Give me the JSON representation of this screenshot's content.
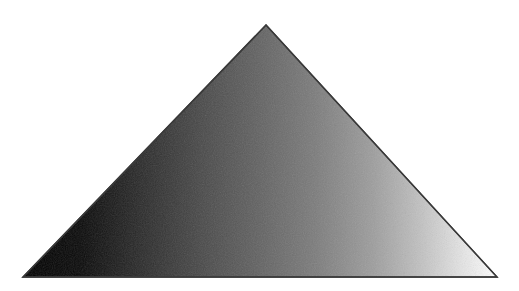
{
  "canvas": {
    "width": 519,
    "height": 291,
    "background_color": "#ffffff",
    "alt_label": "Gradient filled triangle"
  },
  "figure": {
    "name": "gradient-triangle",
    "shape_type": "triangle",
    "vertices": [
      {
        "label": "apex",
        "x": 266,
        "y": 25
      },
      {
        "label": "bottom-right",
        "x": 497,
        "y": 277
      },
      {
        "label": "bottom-left",
        "x": 23,
        "y": 277
      }
    ],
    "points_attr": "266,25 497,277 23,277",
    "stroke_color": "#3a3a3a",
    "stroke_width": 1.4,
    "texture": "fine-dither-noise"
  },
  "gradient": {
    "name": "horizontal-black-to-white",
    "direction": "horizontal",
    "x1": "0%",
    "y1": "0%",
    "x2": "100%",
    "y2": "0%",
    "stops": [
      {
        "offset": "0%",
        "color": "#000000"
      },
      {
        "offset": "12%",
        "color": "#090909"
      },
      {
        "offset": "25%",
        "color": "#2b2b2b"
      },
      {
        "offset": "38%",
        "color": "#4a4a4a"
      },
      {
        "offset": "50%",
        "color": "#636363"
      },
      {
        "offset": "62%",
        "color": "#7d7d7d"
      },
      {
        "offset": "74%",
        "color": "#9e9e9e"
      },
      {
        "offset": "84%",
        "color": "#c2c2c2"
      },
      {
        "offset": "92%",
        "color": "#e2e2e2"
      },
      {
        "offset": "100%",
        "color": "#ffffff"
      }
    ]
  }
}
